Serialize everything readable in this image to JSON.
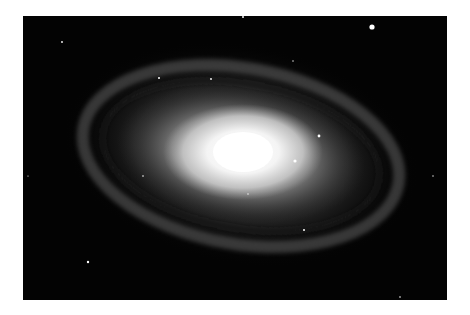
{
  "image": {
    "subject": "Spiral galaxy",
    "alt": "Spiral galaxy with bright white core and dusty spiral arms against black starfield",
    "background": "#030303",
    "page_background": "#ffffff",
    "core_color": "#ffffff",
    "arm_color": "#8a8a8a",
    "stars": [
      {
        "x": 349,
        "y": 11,
        "r": 2.6
      },
      {
        "x": 220,
        "y": 1,
        "r": 1.0
      },
      {
        "x": 39,
        "y": 26,
        "r": 0.9
      },
      {
        "x": 136,
        "y": 62,
        "r": 1.0
      },
      {
        "x": 188,
        "y": 63,
        "r": 0.9
      },
      {
        "x": 272,
        "y": 145,
        "r": 1.6
      },
      {
        "x": 296,
        "y": 120,
        "r": 1.4
      },
      {
        "x": 65,
        "y": 246,
        "r": 1.2
      },
      {
        "x": 281,
        "y": 214,
        "r": 1.0
      },
      {
        "x": 377,
        "y": 281,
        "r": 0.8
      },
      {
        "x": 270,
        "y": 45,
        "r": 0.7
      },
      {
        "x": 410,
        "y": 160,
        "r": 0.7
      },
      {
        "x": 5,
        "y": 160,
        "r": 0.6
      },
      {
        "x": 120,
        "y": 160,
        "r": 0.8
      },
      {
        "x": 225,
        "y": 178,
        "r": 0.7
      }
    ]
  }
}
